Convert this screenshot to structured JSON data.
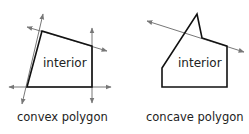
{
  "convex": {
    "caption": "convex polygon",
    "interior_label": "interior"
  },
  "concave": {
    "caption": "concave polygon",
    "interior_label": "interior"
  },
  "colors": {
    "polygon_stroke": "#111111",
    "line_stroke": "#777777",
    "text": "#222222"
  }
}
